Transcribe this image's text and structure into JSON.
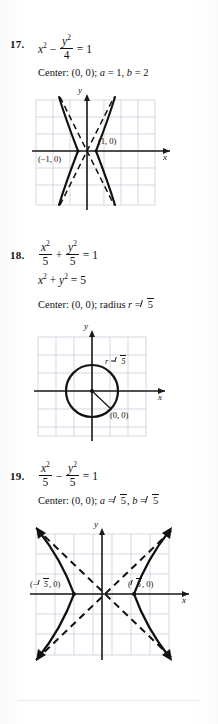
{
  "page": {
    "background_color": "#ffffff",
    "ink_color": "#111111",
    "grid_color": "#c9c4d6",
    "axis_color": "#1a1a1a"
  },
  "problems": [
    {
      "number": "17.",
      "equation": {
        "lhs_term": "x",
        "lhs_exp": "2",
        "operator": "−",
        "frac_num_var": "y",
        "frac_num_exp": "2",
        "frac_den": "4",
        "equals": "= 1"
      },
      "answer_line": "Center: (0, 0); a = 1, b = 2",
      "answer_parts": {
        "center_label": "Center:",
        "center_value": "(0, 0);",
        "a_label": "a",
        "a_value": "= 1,",
        "b_label": "b",
        "b_value": "= 2"
      },
      "graph": {
        "type": "hyperbola-horizontal",
        "axis_label_x": "x",
        "axis_label_y": "y",
        "vertex_left_label": "(−1, 0)",
        "vertex_right_label": "(1, 0)",
        "a": 1,
        "b": 2,
        "asymptotes": "dashed",
        "grid": true
      }
    },
    {
      "number": "18.",
      "equation": {
        "frac1_num_var": "x",
        "frac1_num_exp": "2",
        "frac1_den": "5",
        "operator": "+",
        "frac2_num_var": "y",
        "frac2_num_exp": "2",
        "frac2_den": "5",
        "equals": "= 1"
      },
      "equation2": {
        "term1": "x",
        "term1_exp": "2",
        "operator": "+",
        "term2": "y",
        "term2_exp": "2",
        "equals": "= 5"
      },
      "answer_parts": {
        "center_label": "Center:",
        "center_value": "(0, 0); radius",
        "r_label": "r",
        "r_equals": "=",
        "r_radicand": "5"
      },
      "graph": {
        "type": "circle",
        "axis_label_x": "x",
        "axis_label_y": "y",
        "radius_label_var": "r",
        "radius_label_equals": "=",
        "radius_label_radicand": "5",
        "center_label": "(0, 0)",
        "radius_value": 2.236,
        "grid": true
      }
    },
    {
      "number": "19.",
      "equation": {
        "frac1_num_var": "x",
        "frac1_num_exp": "2",
        "frac1_den": "5",
        "operator": "−",
        "frac2_num_var": "y",
        "frac2_num_exp": "2",
        "frac2_den": "5",
        "equals": "= 1"
      },
      "answer_parts": {
        "center_label": "Center:",
        "center_value": "(0, 0);",
        "a_label": "a",
        "a_equals": "=",
        "a_radicand": "5",
        "comma": ",",
        "b_label": "b",
        "b_equals": "=",
        "b_radicand": "5"
      },
      "graph": {
        "type": "hyperbola-horizontal",
        "axis_label_x": "x",
        "axis_label_y": "y",
        "vertex_left_prefix": "(−",
        "vertex_left_radicand": "5",
        "vertex_left_suffix": ", 0)",
        "vertex_right_prefix": "(",
        "vertex_right_radicand": "5",
        "vertex_right_suffix": ", 0)",
        "a": 2.236,
        "b": 2.236,
        "asymptotes": "dashed",
        "grid": true
      }
    }
  ]
}
